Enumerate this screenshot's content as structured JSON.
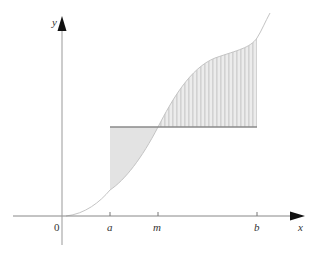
{
  "diagram": {
    "axes": {
      "x_label": "x",
      "y_label": "y",
      "origin_label": "0"
    },
    "ticks": [
      {
        "label": "a"
      },
      {
        "label": "m"
      },
      {
        "label": "b"
      }
    ],
    "elements": [
      "curve y = f(x)",
      "horizontal line y = f(m) from a to b",
      "shaded region between curve and line (a to m, below line)",
      "striped region between curve and line (m to b, above line)"
    ],
    "colors": {
      "axis": "#777777",
      "curve": "#bbbbbb",
      "mean_line": "#888888",
      "fill": "#e2e2e2",
      "stripe": "#d0d0d0"
    }
  }
}
